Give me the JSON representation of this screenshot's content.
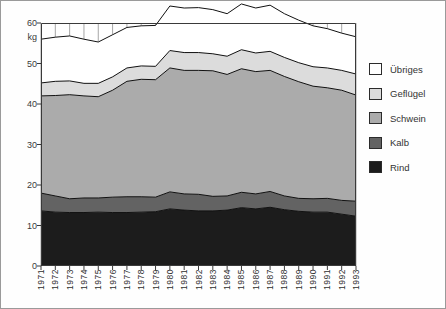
{
  "figure": {
    "top_note": "",
    "border_color": "#9a9a9a"
  },
  "yaxis": {
    "unit_label": "kg",
    "ticks": [
      "60",
      "50",
      "40",
      "30",
      "20",
      "10",
      "0"
    ],
    "tick_values": [
      60,
      50,
      40,
      30,
      20,
      10,
      0
    ]
  },
  "xaxis": {
    "ticks": [
      "1971",
      "1972",
      "1973",
      "1974",
      "1975",
      "1976",
      "1977",
      "1978",
      "1979",
      "1980",
      "1981",
      "1982",
      "1983",
      "1984",
      "1985",
      "1986",
      "1987",
      "1988",
      "1989",
      "1990",
      "1991",
      "1992",
      "1993"
    ]
  },
  "legend": {
    "items": [
      {
        "label": "Übriges",
        "color": "#ffffff"
      },
      {
        "label": "Geflügel",
        "color": "#dcdcdc"
      },
      {
        "label": "Schwein",
        "color": "#ababab"
      },
      {
        "label": "Kalb",
        "color": "#636363"
      },
      {
        "label": "Rind",
        "color": "#1c1c1c"
      }
    ]
  },
  "chart_data": {
    "type": "area",
    "stacked": true,
    "title": "",
    "xlabel": "",
    "ylabel": "kg",
    "ylim": [
      0,
      60
    ],
    "grid": "vertical",
    "legend_position": "right",
    "categories": [
      1971,
      1972,
      1973,
      1974,
      1975,
      1976,
      1977,
      1978,
      1979,
      1980,
      1981,
      1982,
      1983,
      1984,
      1985,
      1986,
      1987,
      1988,
      1989,
      1990,
      1991,
      1992,
      1993
    ],
    "series": [
      {
        "name": "Rind",
        "color": "#1c1c1c",
        "values": [
          13.6,
          13.3,
          13.2,
          13.2,
          13.3,
          13.2,
          13.2,
          13.3,
          13.4,
          14.1,
          13.8,
          13.6,
          13.6,
          13.8,
          14.4,
          14.1,
          14.5,
          13.9,
          13.5,
          13.3,
          13.3,
          12.8,
          12.3
        ]
      },
      {
        "name": "Kalb",
        "color": "#636363",
        "values": [
          4.4,
          4.0,
          3.4,
          3.6,
          3.5,
          3.8,
          3.9,
          3.8,
          3.6,
          4.2,
          4.0,
          4.1,
          3.6,
          3.5,
          3.8,
          3.7,
          3.9,
          3.4,
          3.2,
          3.3,
          3.4,
          3.4,
          3.7
        ]
      },
      {
        "name": "Schwein",
        "color": "#ababab",
        "values": [
          24.0,
          24.8,
          25.7,
          25.2,
          25.0,
          26.4,
          28.5,
          29.0,
          29.0,
          30.6,
          30.5,
          30.6,
          31.0,
          30.0,
          30.5,
          30.2,
          29.9,
          29.5,
          28.8,
          27.8,
          27.3,
          27.2,
          26.2
        ]
      },
      {
        "name": "Geflügel",
        "color": "#dcdcdc",
        "values": [
          3.2,
          3.5,
          3.4,
          3.1,
          3.3,
          3.3,
          3.3,
          3.3,
          3.3,
          4.3,
          4.4,
          4.4,
          4.2,
          4.5,
          4.7,
          4.6,
          4.7,
          4.7,
          4.7,
          4.8,
          4.9,
          4.9,
          5.2
        ]
      },
      {
        "name": "Übriges",
        "color": "#ffffff",
        "values": [
          10.8,
          10.9,
          11.1,
          10.9,
          10.2,
          10.4,
          10.0,
          9.9,
          10.1,
          11.0,
          11.0,
          11.1,
          10.9,
          10.5,
          11.3,
          11.1,
          11.4,
          10.8,
          10.5,
          10.1,
          9.7,
          9.2,
          9.2
        ]
      }
    ]
  }
}
